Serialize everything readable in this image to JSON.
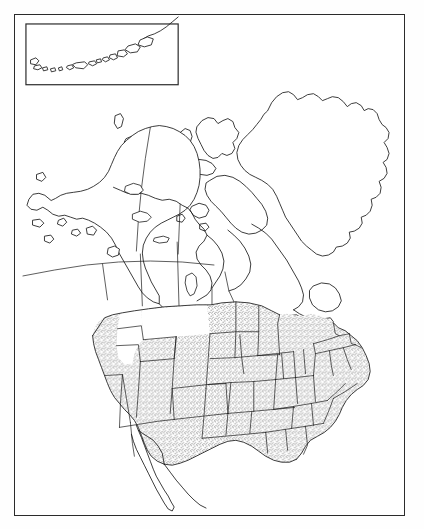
{
  "document": {
    "type": "map",
    "title": "North America outline map",
    "description": "Black-and-white line-art political outline map of North America with the contiguous United States shaded by stipple pattern, an Alaska/Aleutian Islands inset box at the upper left, and a thin rectangular page frame.",
    "background_color": "#ffffff",
    "line_color": "#1a1a1a",
    "frame_color": "#2b2b2b",
    "stipple_color": "#4a4a4a"
  },
  "frame": {
    "name": "page-frame",
    "x": 14,
    "y": 14,
    "width": 391,
    "height": 502,
    "stroke_width": 1.4
  },
  "inset": {
    "name": "aleutian-islands-inset",
    "x": 25,
    "y": 23,
    "width": 153,
    "height": 61,
    "label": "",
    "contents": "Aleutian Islands chain and western Alaska Peninsula"
  },
  "regions": [
    {
      "name": "alaska",
      "shaded": false,
      "label": ""
    },
    {
      "name": "canada",
      "shaded": false,
      "label": ""
    },
    {
      "name": "greenland",
      "shaded": false,
      "label": ""
    },
    {
      "name": "contiguous-united-states",
      "shaded": true,
      "label": ""
    },
    {
      "name": "mexico-baja-california",
      "shaded": false,
      "label": ""
    },
    {
      "name": "great-lakes",
      "shaded": false,
      "label": ""
    }
  ],
  "shading": {
    "style": "stipple",
    "applies_to": "contiguous United States",
    "excluded_states": [
      "Montana",
      "Idaho"
    ],
    "dot_color": "#3f3f3f"
  },
  "boundaries": {
    "state_lines": true,
    "provincial_lines": true,
    "international_lines": true,
    "graticule": false
  },
  "labels": [],
  "legend": null
}
